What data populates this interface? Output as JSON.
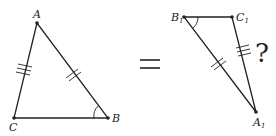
{
  "diagram": {
    "left_triangle": {
      "vertices": {
        "A": {
          "label": "A",
          "x": 37,
          "y": 23
        },
        "C": {
          "label": "C",
          "x": 14,
          "y": 118
        },
        "B": {
          "label": "B",
          "x": 108,
          "y": 118
        }
      },
      "tick_marks": {
        "AC": 3,
        "AB": 2
      },
      "angle_mark": "B"
    },
    "equals_sign": "=",
    "right_triangle": {
      "vertices": {
        "B1": {
          "label": "B",
          "sub": "1",
          "x": 184,
          "y": 17
        },
        "C1": {
          "label": "C",
          "sub": "1",
          "x": 232,
          "y": 17
        },
        "A1": {
          "label": "A",
          "sub": "1",
          "x": 256,
          "y": 112
        }
      },
      "tick_marks": {
        "C1A1": 3,
        "B1A1": 2
      },
      "angle_mark": "B1"
    },
    "question_mark": "?",
    "colors": {
      "stroke": "#222222",
      "background": "#ffffff"
    }
  }
}
